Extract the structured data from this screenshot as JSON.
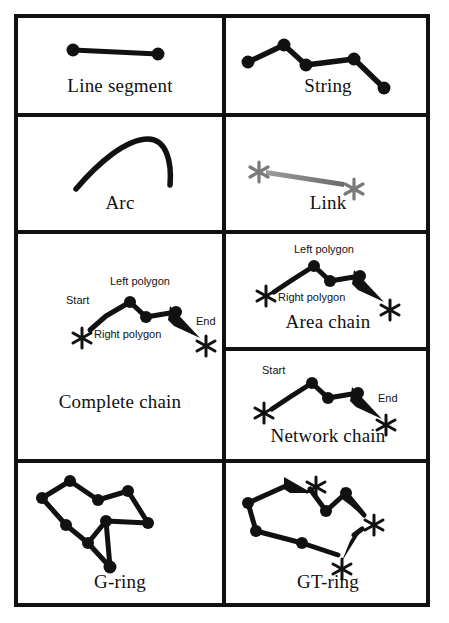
{
  "figure": {
    "border_color": "#111111",
    "background": "#ffffff",
    "line_color": "#111111",
    "link_color": "#808080"
  },
  "cells": [
    {
      "id": "line-segment",
      "caption": "Line segment",
      "geometry": "two nodes joined by a single straight edge",
      "nodes": [
        [
          55,
          32
        ],
        [
          140,
          36
        ]
      ],
      "annotations": []
    },
    {
      "id": "string",
      "caption": "String",
      "geometry": "open polyline through five nodes",
      "nodes": [
        [
          22,
          44
        ],
        [
          58,
          27
        ],
        [
          80,
          47
        ],
        [
          128,
          41
        ],
        [
          158,
          70
        ]
      ],
      "annotations": []
    },
    {
      "id": "arc",
      "caption": "Arc",
      "geometry": "smooth curve with no nodes shown",
      "nodes": [],
      "annotations": []
    },
    {
      "id": "link",
      "caption": "Link",
      "geometry": "tapered gray segment between two gray asterisk nodes",
      "nodes": [
        [
          38,
          36
        ],
        [
          120,
          50
        ]
      ],
      "annotations": [
        {
          "text": "*",
          "x": 30,
          "y": 26,
          "kind": "asterisk-gray"
        },
        {
          "text": "*",
          "x": 118,
          "y": 42,
          "kind": "asterisk-gray"
        }
      ]
    },
    {
      "id": "complete-chain",
      "caption": "Complete chain",
      "geometry": "directed polyline with start and end asterisk nodes and left/right polygon labels",
      "nodes": [
        [
          88,
          82
        ],
        [
          112,
          68
        ],
        [
          128,
          83
        ],
        [
          158,
          78
        ]
      ],
      "annotations": [
        {
          "text": "Start",
          "x": 50,
          "y": 66,
          "kind": "label"
        },
        {
          "text": "Left polygon",
          "x": 94,
          "y": 47,
          "kind": "label"
        },
        {
          "text": "Right polygon",
          "x": 83,
          "y": 94,
          "kind": "label"
        },
        {
          "text": "End",
          "x": 182,
          "y": 84,
          "kind": "label"
        },
        {
          "text": "*",
          "x": 62,
          "y": 84,
          "kind": "asterisk"
        },
        {
          "text": "*",
          "x": 186,
          "y": 100,
          "kind": "asterisk"
        }
      ]
    },
    {
      "id": "area-chain",
      "caption": "Area chain",
      "geometry": "directed polyline with left/right polygon labels and asterisk end nodes",
      "nodes": [
        [
          62,
          45
        ],
        [
          88,
          32
        ],
        [
          104,
          47
        ],
        [
          134,
          42
        ]
      ],
      "annotations": [
        {
          "text": "Left polygon",
          "x": 70,
          "y": 13,
          "kind": "label"
        },
        {
          "text": "Right polygon",
          "x": 60,
          "y": 57,
          "kind": "label"
        },
        {
          "text": "*",
          "x": 38,
          "y": 46,
          "kind": "asterisk"
        },
        {
          "text": "*",
          "x": 161,
          "y": 66,
          "kind": "asterisk"
        }
      ]
    },
    {
      "id": "network-chain",
      "caption": "Network chain",
      "geometry": "directed polyline with start and end asterisk nodes",
      "nodes": [
        [
          60,
          46
        ],
        [
          86,
          32
        ],
        [
          102,
          47
        ],
        [
          132,
          42
        ]
      ],
      "annotations": [
        {
          "text": "Start",
          "x": 40,
          "y": 17,
          "kind": "label"
        },
        {
          "text": "End",
          "x": 158,
          "y": 44,
          "kind": "label"
        },
        {
          "text": "*",
          "x": 36,
          "y": 45,
          "kind": "asterisk"
        },
        {
          "text": "*",
          "x": 156,
          "y": 63,
          "kind": "asterisk"
        }
      ]
    },
    {
      "id": "g-ring",
      "caption": "G-ring",
      "geometry": "closed polygon ring of nodes with an interior spur",
      "nodes": [
        [
          24,
          35
        ],
        [
          52,
          18
        ],
        [
          80,
          37
        ],
        [
          110,
          28
        ],
        [
          130,
          60
        ],
        [
          88,
          58
        ],
        [
          70,
          80
        ],
        [
          48,
          62
        ],
        [
          92,
          104
        ]
      ],
      "annotations": []
    },
    {
      "id": "gt-ring",
      "caption": "GT-ring",
      "geometry": "closed ring built from three directed chains terminating at asterisk nodes",
      "nodes": [
        [
          22,
          40
        ],
        [
          70,
          20
        ],
        [
          110,
          45
        ],
        [
          138,
          22
        ],
        [
          154,
          60
        ],
        [
          118,
          88
        ],
        [
          30,
          68
        ],
        [
          76,
          80
        ]
      ],
      "annotations": [
        {
          "text": "*",
          "x": 78,
          "y": 18,
          "kind": "asterisk"
        },
        {
          "text": "*",
          "x": 160,
          "y": 58,
          "kind": "asterisk"
        },
        {
          "text": "*",
          "x": 106,
          "y": 92,
          "kind": "asterisk"
        }
      ]
    }
  ]
}
